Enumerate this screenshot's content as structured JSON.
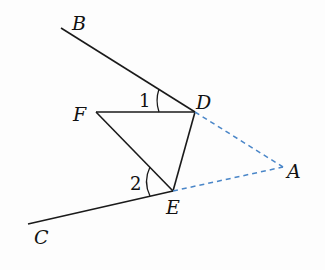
{
  "figure": {
    "type": "geometry",
    "points": {
      "B": {
        "label": "B",
        "x": 61,
        "y": 28
      },
      "D": {
        "label": "D",
        "x": 195,
        "y": 112
      },
      "F": {
        "label": "F",
        "x": 96,
        "y": 112
      },
      "E": {
        "label": "E",
        "x": 173,
        "y": 191
      },
      "A": {
        "label": "A",
        "x": 283,
        "y": 167
      },
      "C": {
        "label": "C",
        "x": 28,
        "y": 224
      }
    },
    "angles": [
      {
        "label": "1",
        "vertex": "D",
        "between": [
          "F",
          "B"
        ]
      },
      {
        "label": "2",
        "vertex": "E",
        "between": [
          "C",
          "F"
        ]
      }
    ],
    "solid_segments": [
      "BD",
      "FD",
      "FE",
      "DE",
      "EC"
    ],
    "dashed_segments": [
      "DA",
      "EA"
    ],
    "colors": {
      "solid": "#1a1a1a",
      "dashed": "#4a86c8"
    }
  }
}
